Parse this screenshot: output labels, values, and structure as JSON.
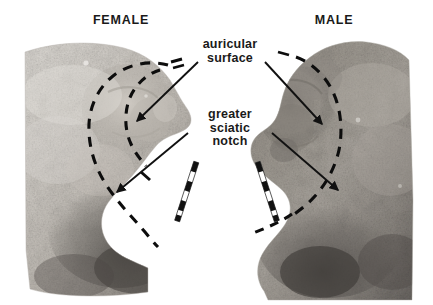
{
  "figure": {
    "width": 433,
    "height": 305,
    "background_color": "#ffffff"
  },
  "labels": {
    "female": "FEMALE",
    "male": "MALE",
    "auricular_surface": "auricular\nsurface",
    "greater_sciatic_notch": "greater\nsciatic\nnotch"
  },
  "specimens": [
    {
      "id": "female-ilium",
      "sex": "FEMALE",
      "side": "left",
      "notch_shape": "wide U-shaped",
      "auricular_surface_outline": "dashed",
      "description": "Female os coxae showing broad greater sciatic notch and raised auricular surface"
    },
    {
      "id": "male-ilium",
      "sex": "MALE",
      "side": "right",
      "notch_shape": "narrow V-shaped",
      "auricular_surface_outline": "dashed",
      "description": "Male os coxae showing narrow greater sciatic notch and flatter auricular surface"
    }
  ],
  "annotations": [
    {
      "id": "arrow-auricular-female",
      "target": "female auricular surface",
      "direction": "down-left"
    },
    {
      "id": "arrow-auricular-male",
      "target": "male auricular surface",
      "direction": "down-right"
    },
    {
      "id": "arrow-notch-female",
      "target": "female greater sciatic notch",
      "direction": "down-left"
    },
    {
      "id": "arrow-notch-male",
      "target": "male greater sciatic notch",
      "direction": "down-right"
    }
  ],
  "scale_bars": [
    {
      "id": "scale-bar-female",
      "orientation": "diagonal",
      "segments": 6,
      "colors": [
        "#111111",
        "#f2f2f2"
      ]
    },
    {
      "id": "scale-bar-male",
      "orientation": "diagonal",
      "segments": 6,
      "colors": [
        "#111111",
        "#f2f2f2"
      ]
    }
  ],
  "colors": {
    "text": "#1a1a1a",
    "arrow": "#111111",
    "dashed_outline": "#0d0d0d",
    "bone_light": "#d8d5d0",
    "bone_mid": "#b3afa9",
    "bone_dark": "#6e6a66",
    "background": "#ffffff"
  }
}
